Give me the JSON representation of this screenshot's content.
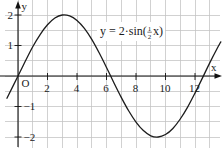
{
  "figure": {
    "equation": {
      "prefix": "y = 2·sin(",
      "frac_num": "1",
      "frac_den": "2",
      "suffix": "x)"
    },
    "axis_labels": {
      "x": "x",
      "y": "y",
      "origin": "O"
    }
  },
  "chart_data": {
    "type": "line",
    "title": "",
    "xlabel": "x",
    "ylabel": "y",
    "annotation": "y = 2·sin(½x)",
    "origin_label": "O",
    "xlim": [
      -1.2,
      13.8
    ],
    "ylim": [
      -2.3,
      2.5
    ],
    "grid": true,
    "grid_step": {
      "x": 1,
      "y": 0.5
    },
    "legend": "none",
    "x_ticks": [
      2,
      4,
      6,
      8,
      10,
      12
    ],
    "x_tick_labels": [
      "2",
      "4",
      "6",
      "8",
      "10",
      "12"
    ],
    "y_ticks": [
      2,
      1,
      -1,
      -2
    ],
    "y_tick_labels": [
      "2",
      "1",
      "−1",
      "−2"
    ],
    "colors": {
      "grid": "#c2c2c2",
      "axis": "#111111",
      "curve": "#1c1c1c"
    },
    "series": [
      {
        "name": "y = 2·sin(½x)",
        "x": [
          -0.75,
          0,
          0.5,
          1,
          1.5,
          2,
          2.5,
          3,
          3.5,
          4,
          4.5,
          5,
          5.5,
          6,
          6.5,
          7,
          7.5,
          8,
          8.5,
          9,
          9.5,
          10,
          10.5,
          11,
          11.5,
          12,
          12.5,
          13,
          13.5,
          13.75
        ],
        "y": [
          -0.73,
          0,
          0.49,
          0.96,
          1.36,
          1.68,
          1.9,
          2.0,
          1.97,
          1.82,
          1.56,
          1.2,
          0.76,
          0.28,
          -0.22,
          -0.7,
          -1.14,
          -1.51,
          -1.79,
          -1.96,
          -2.0,
          -1.92,
          -1.72,
          -1.41,
          -1.02,
          -0.56,
          -0.07,
          0.43,
          0.9,
          1.12
        ]
      }
    ]
  }
}
